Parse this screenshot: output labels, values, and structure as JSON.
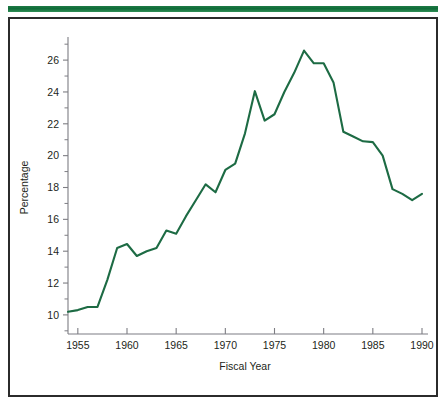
{
  "figure": {
    "accent_color": "#0f6b38",
    "frame_color": "#2b2b2b",
    "background": "#ffffff"
  },
  "chart_data": {
    "type": "line",
    "title": "",
    "subtitle": "",
    "xlabel": "Fiscal Year",
    "ylabel": "Percentage",
    "grid": false,
    "legend": false,
    "legend_position": "none",
    "line_color": "#1d6b44",
    "axis_color": "#7d7d83",
    "xlim": [
      1954,
      1990
    ],
    "ylim": [
      8.8,
      27.2
    ],
    "xticks": [
      1955,
      1960,
      1965,
      1970,
      1975,
      1980,
      1985,
      1990
    ],
    "xticklabels": [
      "1955",
      "1960",
      "1965",
      "1970",
      "1975",
      "1980",
      "1985",
      "1990"
    ],
    "yticks": [
      10,
      12,
      14,
      16,
      18,
      20,
      22,
      24,
      26
    ],
    "yticklabels": [
      "10",
      "12",
      "14",
      "16",
      "18",
      "20",
      "22",
      "24",
      "26"
    ],
    "yticks_minor": [
      9,
      11,
      13,
      15,
      17,
      19,
      21,
      23,
      25,
      27
    ],
    "series": [
      {
        "name": "Percentage",
        "x": [
          1954,
          1955,
          1956,
          1957,
          1958,
          1959,
          1960,
          1961,
          1962,
          1963,
          1964,
          1965,
          1966,
          1967,
          1968,
          1969,
          1970,
          1971,
          1972,
          1973,
          1974,
          1975,
          1976,
          1977,
          1978,
          1979,
          1980,
          1981,
          1982,
          1983,
          1984,
          1985,
          1986,
          1987,
          1988,
          1989,
          1990
        ],
        "y": [
          10.2,
          10.3,
          10.5,
          10.5,
          12.2,
          14.2,
          14.45,
          13.7,
          14.0,
          14.2,
          15.3,
          15.1,
          16.2,
          17.2,
          18.2,
          17.7,
          19.1,
          19.5,
          21.4,
          24.05,
          22.2,
          22.6,
          24.0,
          25.2,
          26.6,
          25.8,
          25.8,
          24.6,
          21.5,
          21.2,
          20.9,
          20.85,
          20.0,
          17.9,
          17.6,
          17.2,
          17.6
        ]
      }
    ]
  }
}
